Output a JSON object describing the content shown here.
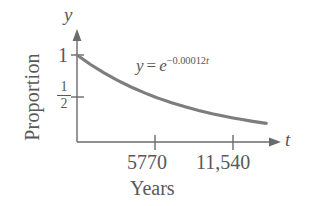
{
  "figure": {
    "background_color": "#ffffff",
    "axis_color": "#6b6b6b",
    "curve_color": "#7d7d7d",
    "text_color": "#585858"
  },
  "axes": {
    "y_variable": "y",
    "x_variable": "t",
    "y_caption": "Proportion",
    "x_caption": "Years",
    "y_ticks": [
      {
        "label": "1",
        "value": 1
      },
      {
        "label": "1/2",
        "numerator": "1",
        "denominator": "2",
        "value": 0.5
      }
    ],
    "x_ticks": [
      {
        "label": "5770",
        "value": 5770
      },
      {
        "label": "11,540",
        "value": 11540
      }
    ]
  },
  "annotation": {
    "equation_lhs": "y",
    "equation_operator": "=",
    "equation_base": "e",
    "equation_exponent": "−0.00012",
    "equation_exponent_variable": "t",
    "equation_full": "y = e^(−0.00012t)"
  },
  "chart_data": {
    "type": "line",
    "title": "",
    "subtitle": "",
    "xlabel": "Years",
    "ylabel": "Proportion",
    "xlim": [
      0,
      17000
    ],
    "ylim": [
      0,
      1.12
    ],
    "grid": false,
    "legend": "none",
    "annotations": [
      "y = e^(−0.00012t)"
    ],
    "xticks": [
      5770,
      11540
    ],
    "xticklabels": [
      "5770",
      "11,540"
    ],
    "yticks": [
      0.5,
      1
    ],
    "yticklabels": [
      "1/2",
      "1"
    ],
    "series": [
      {
        "name": "y = e^(-0.00012t)",
        "color": "#7d7d7d",
        "x": [
          0,
          1000,
          2000,
          3000,
          4000,
          5000,
          5770,
          6000,
          7000,
          8000,
          9000,
          10000,
          11000,
          11540,
          12000,
          13000,
          14000,
          15000,
          16000
        ],
        "y": [
          1.0,
          0.887,
          0.787,
          0.697,
          0.619,
          0.549,
          0.5,
          0.487,
          0.432,
          0.383,
          0.339,
          0.301,
          0.267,
          0.25,
          0.237,
          0.21,
          0.186,
          0.165,
          0.146
        ]
      }
    ]
  }
}
